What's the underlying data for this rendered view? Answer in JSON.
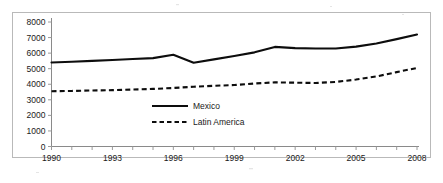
{
  "chart_data": {
    "type": "line",
    "title": "",
    "subtitle": "",
    "xlabel": "",
    "ylabel": "",
    "x": [
      1990,
      1991,
      1992,
      1993,
      1994,
      1995,
      1996,
      1997,
      1998,
      1999,
      2000,
      2001,
      2002,
      2003,
      2004,
      2005,
      2006,
      2007,
      2008
    ],
    "xlim": [
      1990,
      2008
    ],
    "ylim": [
      0,
      8000
    ],
    "y_ticks": [
      0,
      1000,
      2000,
      3000,
      4000,
      5000,
      6000,
      7000,
      8000
    ],
    "y_tick_labels": [
      "0",
      "1000",
      "2000",
      "3000",
      "4000",
      "5000",
      "6000",
      "7000",
      "8000"
    ],
    "x_tick_labels": [
      "1990",
      "1993",
      "1996",
      "1999",
      "2002",
      "2005",
      "2008"
    ],
    "x_tick_values": [
      1990,
      1993,
      1996,
      1999,
      2002,
      2005,
      2008
    ],
    "x_minor_ticks_every_year": true,
    "grid": false,
    "legend_position": "inside-center",
    "series": [
      {
        "name": "Mexico",
        "style": "solid",
        "color": "#0d0d0d",
        "values": [
          5400,
          5450,
          5500,
          5560,
          5620,
          5680,
          5900,
          5380,
          5600,
          5820,
          6050,
          6400,
          6320,
          6300,
          6300,
          6420,
          6620,
          6900,
          7200
        ]
      },
      {
        "name": "Latin America",
        "style": "dashed",
        "color": "#0d0d0d",
        "values": [
          3550,
          3570,
          3600,
          3620,
          3660,
          3700,
          3760,
          3840,
          3900,
          3950,
          4050,
          4120,
          4100,
          4080,
          4150,
          4300,
          4500,
          4780,
          5050
        ]
      }
    ],
    "legend": [
      {
        "label": "Mexico",
        "style": "solid"
      },
      {
        "label": "Latin America",
        "style": "dashed"
      }
    ]
  }
}
